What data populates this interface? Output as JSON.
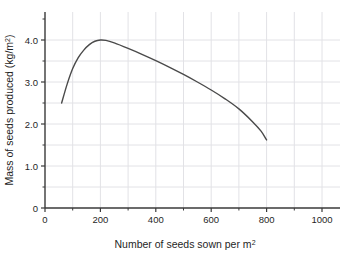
{
  "chart_data": {
    "type": "line",
    "title": "",
    "xlabel": "Number of seeds sown per m2",
    "xlabel_main": "Number of seeds sown per m",
    "xlabel_sup": "2",
    "ylabel": "Mass of seeds produced (kg/m2)",
    "ylabel_main": "Mass of seeds produced (kg/m",
    "ylabel_sup": "2",
    "ylabel_tail": ")",
    "xlim": [
      0,
      1060
    ],
    "ylim": [
      0,
      4.55
    ],
    "grid": true,
    "legend": null,
    "x_major_ticks": [
      0,
      200,
      400,
      600,
      800,
      1000
    ],
    "x_major_labels": [
      "0",
      "200",
      "400",
      "600",
      "800",
      "1000"
    ],
    "x_minor_ticks": [
      100,
      300,
      500,
      700,
      900
    ],
    "x_gridlines": [
      100,
      200,
      300,
      400,
      500,
      600,
      700,
      800,
      900,
      1000
    ],
    "y_major_ticks": [
      0,
      1.0,
      2.0,
      3.0,
      4.0
    ],
    "y_major_labels": [
      "0",
      "1.0",
      "2.0",
      "3.0",
      "4.0"
    ],
    "y_minor_ticks": [
      0.5,
      1.5,
      2.5,
      3.5
    ],
    "y_gridlines": [
      0.5,
      1.0,
      1.5,
      2.0,
      2.5,
      3.0,
      3.5,
      4.0
    ],
    "series": [
      {
        "name": "mass of seeds produced",
        "color": "#4a4a4a",
        "points": [
          [
            60,
            2.5
          ],
          [
            80,
            2.95
          ],
          [
            100,
            3.32
          ],
          [
            120,
            3.58
          ],
          [
            140,
            3.76
          ],
          [
            160,
            3.89
          ],
          [
            180,
            3.97
          ],
          [
            200,
            4.0
          ],
          [
            220,
            3.99
          ],
          [
            250,
            3.93
          ],
          [
            300,
            3.8
          ],
          [
            350,
            3.66
          ],
          [
            400,
            3.51
          ],
          [
            450,
            3.35
          ],
          [
            500,
            3.18
          ],
          [
            550,
            3.0
          ],
          [
            600,
            2.81
          ],
          [
            650,
            2.6
          ],
          [
            700,
            2.36
          ],
          [
            750,
            2.05
          ],
          [
            780,
            1.83
          ],
          [
            800,
            1.62
          ]
        ]
      }
    ],
    "annotations": []
  },
  "style": {
    "axis_color": "#3a3a3a",
    "grid_color": "#e2e2e6",
    "curve_color": "#4a4a4a",
    "background": "#ffffff",
    "text_color": "#1f1f1f"
  }
}
